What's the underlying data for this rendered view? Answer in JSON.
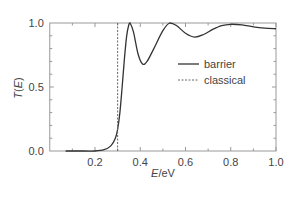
{
  "chart_data": {
    "type": "line",
    "title": "",
    "xlabel": "E/eV",
    "ylabel": "T(E)",
    "xlim": [
      0.0,
      1.0
    ],
    "ylim": [
      0.0,
      1.0
    ],
    "x_ticks": [
      "0.2",
      "0.4",
      "0.6",
      "0.8",
      "1.0"
    ],
    "y_ticks": [
      "0.0",
      "0.5",
      "1.0"
    ],
    "grid": false,
    "legend_position": "center-right",
    "series": [
      {
        "name": "barrier",
        "style": "solid",
        "x": [
          0.07,
          0.15,
          0.2,
          0.24,
          0.27,
          0.29,
          0.3,
          0.31,
          0.32,
          0.33,
          0.34,
          0.35,
          0.355,
          0.37,
          0.39,
          0.41,
          0.43,
          0.46,
          0.5,
          0.53,
          0.56,
          0.6,
          0.64,
          0.68,
          0.72,
          0.76,
          0.8,
          0.85,
          0.9,
          0.95,
          1.0
        ],
        "y": [
          0.0,
          0.0,
          0.0,
          0.01,
          0.04,
          0.1,
          0.17,
          0.3,
          0.5,
          0.72,
          0.9,
          0.99,
          1.0,
          0.93,
          0.76,
          0.68,
          0.7,
          0.8,
          0.94,
          1.0,
          0.98,
          0.92,
          0.89,
          0.91,
          0.95,
          0.98,
          0.99,
          0.985,
          0.97,
          0.96,
          0.955
        ]
      },
      {
        "name": "classical",
        "style": "dashed",
        "x": [
          0.3,
          0.3
        ],
        "y": [
          0.0,
          1.0
        ]
      }
    ]
  },
  "legend": {
    "items": [
      {
        "label": "barrier"
      },
      {
        "label": "classical"
      }
    ]
  },
  "axes": {
    "xlabel_italic": "E",
    "xlabel_unit": "/eV",
    "ylabel_italic_1": "T",
    "ylabel_paren_open": "(",
    "ylabel_italic_2": "E",
    "ylabel_paren_close": ")"
  }
}
